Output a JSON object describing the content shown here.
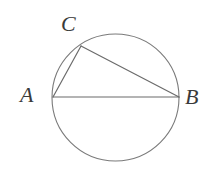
{
  "figure": {
    "kind": "geometry-diagram",
    "background_color": "#ffffff",
    "stroke_color": "#6b6b6b",
    "label_color": "#3a3a3a",
    "width": 214,
    "height": 169
  },
  "circle": {
    "name": "circumscribed-circle",
    "center_x": 115.5,
    "center_y": 97.5,
    "radius": 63.5,
    "stroke": "#7a7a7a",
    "stroke_width": 1.1,
    "fill": "none"
  },
  "points": {
    "A": {
      "label": "A",
      "x": 53,
      "y": 97,
      "label_x": 20,
      "label_y": 84
    },
    "B": {
      "label": "B",
      "x": 179,
      "y": 97,
      "label_x": 185,
      "label_y": 86
    },
    "C": {
      "label": "C",
      "x": 81,
      "y": 46,
      "label_x": 61,
      "label_y": 13
    }
  },
  "segments": [
    {
      "name": "segment-AB",
      "from": "A",
      "to": "B",
      "x1": 53,
      "y1": 97,
      "x2": 179,
      "y2": 97,
      "stroke": "#6b6b6b",
      "stroke_width": 1.2
    },
    {
      "name": "segment-AC",
      "from": "A",
      "to": "C",
      "x1": 53,
      "y1": 97,
      "x2": 81,
      "y2": 46,
      "stroke": "#6b6b6b",
      "stroke_width": 1.2
    },
    {
      "name": "segment-CB",
      "from": "C",
      "to": "B",
      "x1": 81,
      "y1": 46,
      "x2": 179,
      "y2": 97,
      "stroke": "#6b6b6b",
      "stroke_width": 1.2
    }
  ]
}
